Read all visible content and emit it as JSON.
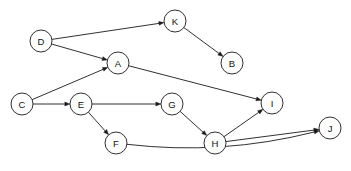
{
  "diagram": {
    "type": "directed-graph",
    "background_color": "#ffffff",
    "stroke_color": "#1a1a1a",
    "node_fill_color": "#ffffff",
    "label_color": "#111111",
    "node_radius": 11,
    "width": 351,
    "height": 171,
    "nodes": [
      {
        "id": "D",
        "label": "D",
        "cx": 41,
        "cy": 41
      },
      {
        "id": "K",
        "label": "K",
        "cx": 175,
        "cy": 21
      },
      {
        "id": "A",
        "label": "A",
        "cx": 118,
        "cy": 63
      },
      {
        "id": "B",
        "label": "B",
        "cx": 232,
        "cy": 63
      },
      {
        "id": "C",
        "label": "C",
        "cx": 22,
        "cy": 104
      },
      {
        "id": "E",
        "label": "E",
        "cx": 81,
        "cy": 104
      },
      {
        "id": "G",
        "label": "G",
        "cx": 172,
        "cy": 104
      },
      {
        "id": "I",
        "label": "I",
        "cx": 272,
        "cy": 103
      },
      {
        "id": "F",
        "label": "F",
        "cx": 116,
        "cy": 143
      },
      {
        "id": "H",
        "label": "H",
        "cx": 215,
        "cy": 143
      },
      {
        "id": "J",
        "label": "J",
        "cx": 330,
        "cy": 128
      }
    ],
    "edges": [
      {
        "from": "D",
        "to": "K",
        "curved": false
      },
      {
        "from": "D",
        "to": "A",
        "curved": false
      },
      {
        "from": "K",
        "to": "B",
        "curved": false
      },
      {
        "from": "C",
        "to": "A",
        "curved": false
      },
      {
        "from": "C",
        "to": "E",
        "curved": false
      },
      {
        "from": "E",
        "to": "G",
        "curved": false
      },
      {
        "from": "E",
        "to": "F",
        "curved": false
      },
      {
        "from": "G",
        "to": "H",
        "curved": false
      },
      {
        "from": "A",
        "to": "I",
        "curved": false
      },
      {
        "from": "H",
        "to": "I",
        "curved": false
      },
      {
        "from": "H",
        "to": "J",
        "curved": false
      },
      {
        "from": "F",
        "to": "J",
        "curved": true,
        "bow": 20
      }
    ]
  }
}
